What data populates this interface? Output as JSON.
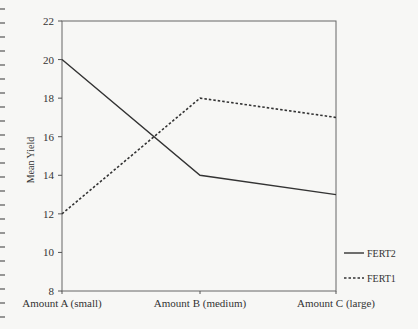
{
  "chart_data": {
    "type": "line",
    "title": "",
    "xlabel": "",
    "ylabel": "Mean Yield",
    "categories": [
      "Amount A (small)",
      "Amount B (medium)",
      "Amount C (large)"
    ],
    "series": [
      {
        "name": "FERT2",
        "style": "solid",
        "values": [
          20,
          14,
          13
        ]
      },
      {
        "name": "FERT1",
        "style": "dashed",
        "values": [
          12,
          18,
          17
        ]
      }
    ],
    "ylim": [
      8,
      22
    ],
    "yticks": [
      8,
      10,
      12,
      14,
      16,
      18,
      20,
      22
    ],
    "grid": false,
    "legend_position": "right-bottom",
    "colors": {
      "line": "#333333",
      "axis": "#555555"
    }
  }
}
